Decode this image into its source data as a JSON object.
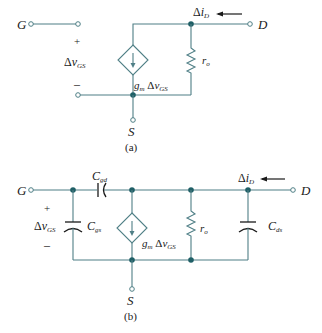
{
  "figure": {
    "colors": {
      "wire": "#4f7f86",
      "node": "#1f5f66",
      "text": "#1a1a1a"
    },
    "circuit_a": {
      "caption": "(a)",
      "terminals": {
        "gate": "G",
        "drain": "D",
        "source": "S"
      },
      "vgs": {
        "plus": "+",
        "delta": "Δ",
        "v": "v",
        "sub": "GS",
        "minus": "–"
      },
      "current": {
        "delta": "Δ",
        "i": "i",
        "sub": "D"
      },
      "resistor": {
        "name": "r",
        "sub": "o"
      },
      "source_label": {
        "gm": "g",
        "gm_sub": "m",
        "delta": "Δ",
        "v": "v",
        "sub": "GS"
      }
    },
    "circuit_b": {
      "caption": "(b)",
      "terminals": {
        "gate": "G",
        "drain": "D",
        "source": "S"
      },
      "vgs": {
        "plus": "+",
        "delta": "Δ",
        "v": "v",
        "sub": "GS",
        "minus": "–"
      },
      "current": {
        "delta": "Δ",
        "i": "i",
        "sub": "D"
      },
      "resistor": {
        "name": "r",
        "sub": "o"
      },
      "source_label": {
        "gm": "g",
        "gm_sub": "m",
        "delta": "Δ",
        "v": "v",
        "sub": "GS"
      },
      "cgd": {
        "name": "C",
        "sub": "gd"
      },
      "cgs": {
        "name": "C",
        "sub": "gs"
      },
      "cds": {
        "name": "C",
        "sub": "ds"
      }
    }
  }
}
